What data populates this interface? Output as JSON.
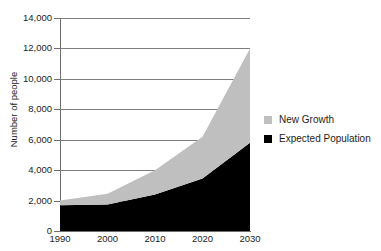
{
  "chart_data": {
    "type": "area",
    "stacked": true,
    "title": "",
    "xlabel": "",
    "ylabel": "Number of people",
    "categories": [
      "1990",
      "2000",
      "2010",
      "2020",
      "2030"
    ],
    "x": [
      1990,
      2000,
      2010,
      2020,
      2030
    ],
    "xlim": [
      1990,
      2030
    ],
    "ylim": [
      0,
      14000
    ],
    "ytick_labels": [
      "0",
      "2,000",
      "4,000",
      "6,000",
      "8,000",
      "10,000",
      "12,000",
      "14,000"
    ],
    "ytick_values": [
      0,
      2000,
      4000,
      6000,
      8000,
      10000,
      12000,
      14000
    ],
    "xtick_labels": [
      "1990",
      "2000",
      "2010",
      "2020",
      "2030"
    ],
    "grid": "horizontal",
    "legend_position": "right",
    "series": [
      {
        "name": "Expected Population",
        "color": "#000000",
        "values": [
          1700,
          1750,
          2400,
          3450,
          5800
        ]
      },
      {
        "name": "New Growth",
        "color": "#bfbfbf",
        "values": [
          300,
          700,
          1600,
          2750,
          6200
        ]
      }
    ],
    "totals": [
      2000,
      2450,
      4000,
      6200,
      12000
    ]
  },
  "legend": {
    "items": [
      {
        "label": "New Growth",
        "color": "#bfbfbf"
      },
      {
        "label": "Expected Population",
        "color": "#000000"
      }
    ]
  }
}
